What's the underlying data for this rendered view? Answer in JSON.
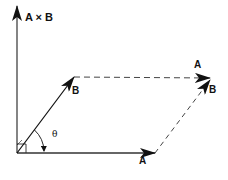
{
  "diagram": {
    "labels": {
      "axis": "A × B",
      "vector_b": "B",
      "vector_a": "A",
      "top_a": "A",
      "right_b": "B",
      "angle": "θ"
    },
    "colors": {
      "stroke": "#111111",
      "axis": "#333333",
      "dashed": "#444444",
      "background": "#ffffff"
    }
  }
}
